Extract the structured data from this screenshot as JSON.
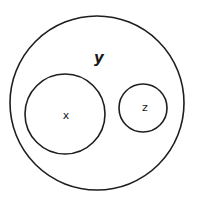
{
  "diagram": {
    "type": "venn-euler",
    "stroke_color": "#1e1e1e",
    "background": "#ffffff",
    "sets": [
      {
        "id": "y",
        "label": "y",
        "cx": 97,
        "cy": 103,
        "r": 87,
        "label_x": 99,
        "label_y": 63,
        "contains": [
          "x",
          "z"
        ]
      },
      {
        "id": "x",
        "label": "x",
        "cx": 65,
        "cy": 114,
        "r": 40,
        "label_x": 66,
        "label_y": 119,
        "contains": []
      },
      {
        "id": "z",
        "label": "z",
        "cx": 143,
        "cy": 108,
        "r": 24,
        "label_x": 145,
        "label_y": 111,
        "contains": []
      }
    ],
    "relationships": [
      {
        "subset": "x",
        "superset": "y"
      },
      {
        "subset": "z",
        "superset": "y"
      },
      {
        "disjoint": [
          "x",
          "z"
        ]
      }
    ]
  }
}
